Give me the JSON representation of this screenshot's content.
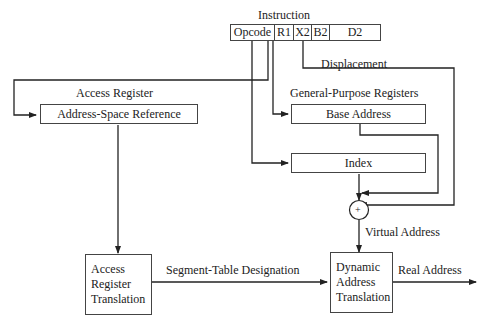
{
  "instruction": {
    "title": "Instruction",
    "fields": [
      "Opcode",
      "R1",
      "X2",
      "B2",
      "D2"
    ]
  },
  "labels": {
    "access_register": "Access Register",
    "general_purpose_registers": "General-Purpose Registers",
    "displacement": "Displacement",
    "virtual_address": "Virtual Address",
    "segment_table_designation": "Segment-Table Designation",
    "real_address": "Real Address"
  },
  "boxes": {
    "address_space_reference": "Address-Space Reference",
    "base_address": "Base Address",
    "index": "Index",
    "adder": "+",
    "access_register_translation": [
      "Access",
      "Register",
      "Translation"
    ],
    "dynamic_address_translation": [
      "Dynamic",
      "Address",
      "Translation"
    ]
  }
}
